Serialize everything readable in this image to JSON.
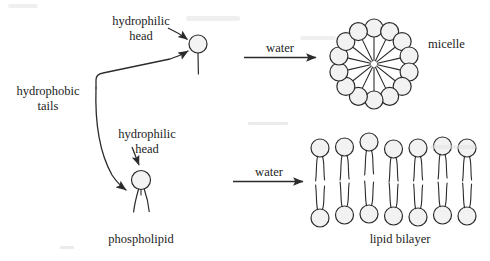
{
  "figure": {
    "title_absent": true,
    "ink_color": "#2b2b2b",
    "head_fill": "#f2f2f2",
    "paper_color": "#ffffff"
  },
  "labels": {
    "hydrophilic_head_top_line1": "hydrophilic",
    "hydrophilic_head_top_line2": "head",
    "hydrophobic_tails_line1": "hydrophobic",
    "hydrophobic_tails_line2": "tails",
    "hydrophilic_head_mid_line1": "hydrophilic",
    "hydrophilic_head_mid_line2": "head",
    "phospholipid": "phospholipid",
    "micelle": "micelle",
    "lipid_bilayer": "lipid bilayer",
    "arrow_top": "water",
    "arrow_bottom": "water"
  },
  "structures": {
    "single_tail_lipid": {
      "name": "single-tail lipid",
      "head_cx": 198,
      "head_cy": 44,
      "head_r": 9,
      "tails": 1
    },
    "phospholipid": {
      "name": "phospholipid",
      "head_cx": 141,
      "head_cy": 180,
      "head_r": 9.5,
      "tails": 2
    },
    "micelle": {
      "center_x": 374,
      "center_y": 64,
      "ring_radius": 36,
      "head_count": 14,
      "head_r": 9
    },
    "bilayer": {
      "top_row_count": 7,
      "bottom_row_count": 7,
      "head_r": 9,
      "left_x": 320,
      "spacing": 24.5,
      "top_row_y": 148,
      "bottom_row_y": 215
    }
  },
  "arrows": {
    "reaction_top": {
      "x1": 244,
      "y1": 57,
      "x2": 318,
      "y2": 57
    },
    "reaction_bottom": {
      "x1": 233,
      "y1": 181,
      "x2": 305,
      "y2": 181
    },
    "pointer_head_top": {
      "from_x": 168,
      "from_y": 28,
      "to_x": 188,
      "to_y": 40
    },
    "pointer_head_mid": {
      "from_x": 133,
      "from_y": 148,
      "to_x": 140,
      "to_y": 166
    }
  },
  "connector": {
    "name": "hydrophobic-tails-bracket",
    "description": "bracket from label splitting into two curved arrows pointing at the tails of both lipids"
  }
}
